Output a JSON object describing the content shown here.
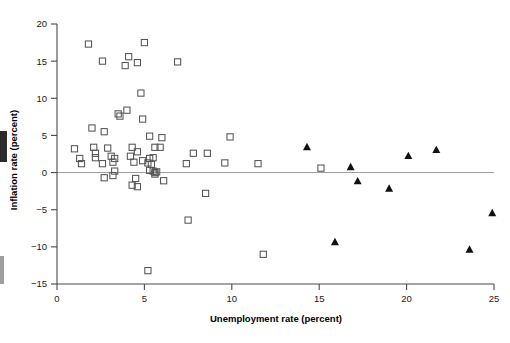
{
  "figure": {
    "type": "scatter-plot",
    "background": "#ffffff",
    "axis_color": "#4a4a4a",
    "zero_line_color": "#9a9a9a",
    "marker_open_square_color": "#555555",
    "marker_filled_triangle_color": "#111111"
  },
  "axes": {
    "x": {
      "title": "Unemployment rate (percent)",
      "ticks": [
        "0",
        "5",
        "10",
        "15",
        "20",
        "25"
      ],
      "tick_values": [
        0,
        5,
        10,
        15,
        20,
        25
      ],
      "min": 0,
      "max": 25
    },
    "y": {
      "title": "Inflation rate (percent)",
      "ticks": [
        "20",
        "15",
        "10",
        "5",
        "0",
        "−5",
        "−10",
        "−15"
      ],
      "tick_values": [
        20,
        15,
        10,
        5,
        0,
        -5,
        -10,
        -15
      ],
      "min": -15,
      "max": 20
    }
  },
  "chart_data": {
    "type": "scatter",
    "title": "",
    "xlabel": "Unemployment rate (percent)",
    "ylabel": "Inflation rate (percent)",
    "xlim": [
      0,
      25
    ],
    "ylim": [
      -15,
      20
    ],
    "grid": false,
    "legend": false,
    "annotations": [
      {
        "kind": "reference-line",
        "axis": "y",
        "value": 0,
        "label": ""
      }
    ],
    "series": [
      {
        "name": "open-square",
        "marker": "open-square",
        "color": "#555555",
        "points": [
          [
            1.8,
            17.3
          ],
          [
            5.0,
            17.5
          ],
          [
            2.6,
            15.0
          ],
          [
            4.1,
            15.6
          ],
          [
            3.9,
            14.4
          ],
          [
            4.6,
            14.8
          ],
          [
            6.9,
            14.9
          ],
          [
            4.8,
            10.7
          ],
          [
            3.5,
            7.9
          ],
          [
            3.6,
            7.6
          ],
          [
            4.0,
            8.4
          ],
          [
            4.9,
            7.2
          ],
          [
            2.0,
            6.0
          ],
          [
            2.7,
            5.5
          ],
          [
            5.3,
            4.9
          ],
          [
            6.0,
            4.7
          ],
          [
            9.9,
            4.8
          ],
          [
            1.0,
            3.2
          ],
          [
            2.1,
            3.4
          ],
          [
            2.9,
            3.3
          ],
          [
            4.3,
            3.4
          ],
          [
            5.6,
            3.4
          ],
          [
            5.9,
            3.4
          ],
          [
            2.2,
            2.6
          ],
          [
            4.6,
            2.8
          ],
          [
            7.8,
            2.6
          ],
          [
            8.6,
            2.6
          ],
          [
            1.3,
            1.9
          ],
          [
            2.2,
            2.0
          ],
          [
            3.1,
            2.2
          ],
          [
            3.3,
            1.9
          ],
          [
            4.2,
            2.2
          ],
          [
            4.9,
            1.6
          ],
          [
            5.3,
            1.9
          ],
          [
            5.5,
            2.0
          ],
          [
            1.4,
            1.2
          ],
          [
            2.6,
            1.2
          ],
          [
            3.2,
            1.4
          ],
          [
            4.4,
            1.4
          ],
          [
            5.2,
            1.3
          ],
          [
            5.4,
            1.1
          ],
          [
            7.4,
            1.2
          ],
          [
            9.6,
            1.3
          ],
          [
            11.5,
            1.2
          ],
          [
            3.3,
            0.2
          ],
          [
            5.3,
            0.3
          ],
          [
            5.5,
            0.2
          ],
          [
            5.6,
            0.0
          ],
          [
            5.7,
            0.1
          ],
          [
            5.6,
            -0.2
          ],
          [
            15.1,
            0.6
          ],
          [
            2.7,
            -0.7
          ],
          [
            3.2,
            -0.4
          ],
          [
            4.5,
            -0.8
          ],
          [
            6.1,
            -1.1
          ],
          [
            4.3,
            -1.7
          ],
          [
            4.6,
            -1.9
          ],
          [
            8.5,
            -2.8
          ],
          [
            7.5,
            -6.4
          ],
          [
            11.8,
            -11.0
          ],
          [
            5.2,
            -13.2
          ]
        ]
      },
      {
        "name": "filled-triangle",
        "marker": "filled-triangle",
        "color": "#111111",
        "points": [
          [
            14.3,
            3.4
          ],
          [
            20.1,
            2.2
          ],
          [
            21.7,
            3.0
          ],
          [
            16.8,
            0.7
          ],
          [
            17.2,
            -1.2
          ],
          [
            19.0,
            -2.2
          ],
          [
            24.9,
            -5.5
          ],
          [
            15.9,
            -9.4
          ],
          [
            23.6,
            -10.4
          ]
        ]
      }
    ]
  }
}
